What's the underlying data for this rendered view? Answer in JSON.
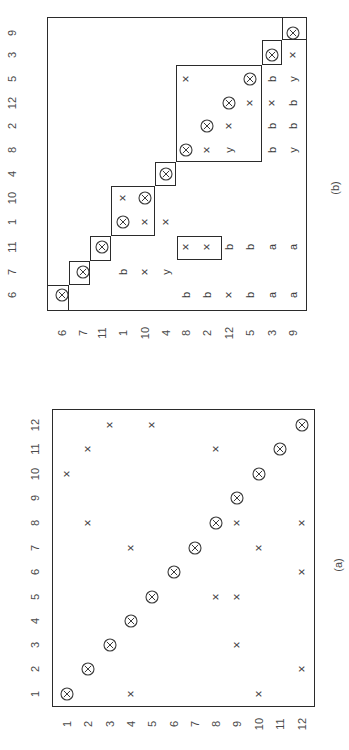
{
  "figure": {
    "orientation": "rotated -90deg",
    "panels": [
      {
        "id": "a",
        "caption": "(a)",
        "caption_pos": [
          338,
          565
        ],
        "frame": {
          "left": 52,
          "top": 409,
          "right": 315,
          "bottom": 707
        },
        "row_labels": [
          "1",
          "2",
          "3",
          "4",
          "5",
          "6",
          "7",
          "8",
          "9",
          "10",
          "11",
          "12"
        ],
        "col_labels": [
          "1",
          "2",
          "3",
          "4",
          "5",
          "6",
          "7",
          "8",
          "9",
          "10",
          "11",
          "12"
        ],
        "row_label_x": 35,
        "row_y": {
          "1": 694,
          "2": 669,
          "3": 645,
          "4": 621,
          "5": 597,
          "6": 572,
          "7": 548,
          "8": 523,
          "9": 498,
          "10": 474,
          "11": 449,
          "12": 425
        },
        "col_label_y": 724,
        "col_x": {
          "1": 67,
          "2": 88,
          "3": 110,
          "4": 131,
          "5": 152,
          "6": 174,
          "7": 195,
          "8": 216,
          "9": 237,
          "10": 259,
          "11": 280,
          "12": 302
        },
        "entries": [
          {
            "row": "1",
            "col": "1",
            "v": "⊗"
          },
          {
            "row": "1",
            "col": "4",
            "v": "×"
          },
          {
            "row": "1",
            "col": "10",
            "v": "×"
          },
          {
            "row": "2",
            "col": "2",
            "v": "⊗"
          },
          {
            "row": "2",
            "col": "12",
            "v": "×"
          },
          {
            "row": "3",
            "col": "3",
            "v": "⊗"
          },
          {
            "row": "3",
            "col": "9",
            "v": "×"
          },
          {
            "row": "4",
            "col": "4",
            "v": "⊗"
          },
          {
            "row": "5",
            "col": "5",
            "v": "⊗"
          },
          {
            "row": "5",
            "col": "8",
            "v": "×"
          },
          {
            "row": "5",
            "col": "9",
            "v": "×"
          },
          {
            "row": "6",
            "col": "6",
            "v": "⊗"
          },
          {
            "row": "6",
            "col": "12",
            "v": "×"
          },
          {
            "row": "7",
            "col": "4",
            "v": "×"
          },
          {
            "row": "7",
            "col": "7",
            "v": "⊗"
          },
          {
            "row": "7",
            "col": "10",
            "v": "×"
          },
          {
            "row": "8",
            "col": "2",
            "v": "×"
          },
          {
            "row": "8",
            "col": "8",
            "v": "⊗"
          },
          {
            "row": "8",
            "col": "9",
            "v": "×"
          },
          {
            "row": "8",
            "col": "12",
            "v": "×"
          },
          {
            "row": "9",
            "col": "9",
            "v": "⊗"
          },
          {
            "row": "10",
            "col": "1",
            "v": "×"
          },
          {
            "row": "10",
            "col": "10",
            "v": "⊗"
          },
          {
            "row": "11",
            "col": "2",
            "v": "×"
          },
          {
            "row": "11",
            "col": "8",
            "v": "×"
          },
          {
            "row": "11",
            "col": "11",
            "v": "⊗"
          },
          {
            "row": "12",
            "col": "3",
            "v": "×"
          },
          {
            "row": "12",
            "col": "5",
            "v": "×"
          },
          {
            "row": "12",
            "col": "12",
            "v": "⊗"
          }
        ],
        "blocks": []
      },
      {
        "id": "b",
        "caption": "(b)",
        "caption_pos": [
          335,
          188
        ],
        "frame": {
          "left": 47,
          "top": 17,
          "right": 307,
          "bottom": 311
        },
        "row_labels": [
          "6",
          "7",
          "11",
          "1",
          "10",
          "4",
          "8",
          "2",
          "12",
          "5",
          "3",
          "9"
        ],
        "col_labels": [
          "6",
          "7",
          "11",
          "1",
          "10",
          "4",
          "8",
          "2",
          "12",
          "5",
          "3",
          "9"
        ],
        "row_label_x": 12,
        "row_y": {
          "6": 295,
          "7": 272,
          "11": 247,
          "1": 222,
          "10": 198,
          "4": 174,
          "8": 150,
          "2": 126,
          "12": 103,
          "5": 79,
          "3": 55,
          "9": 33
        },
        "col_label_y": 333,
        "col_x": {
          "6": 62,
          "7": 83,
          "11": 102,
          "1": 123,
          "10": 145,
          "4": 166,
          "8": 186,
          "2": 207,
          "12": 229,
          "5": 250,
          "3": 272,
          "9": 293
        },
        "entries": [
          {
            "row": "6",
            "col": "6",
            "v": "⊗"
          },
          {
            "row": "6",
            "col": "8",
            "v": "b"
          },
          {
            "row": "6",
            "col": "2",
            "v": "b"
          },
          {
            "row": "6",
            "col": "12",
            "v": "×"
          },
          {
            "row": "6",
            "col": "5",
            "v": "b"
          },
          {
            "row": "6",
            "col": "3",
            "v": "a"
          },
          {
            "row": "6",
            "col": "9",
            "v": "a"
          },
          {
            "row": "7",
            "col": "7",
            "v": "⊗"
          },
          {
            "row": "7",
            "col": "1",
            "v": "b"
          },
          {
            "row": "7",
            "col": "10",
            "v": "×"
          },
          {
            "row": "7",
            "col": "4",
            "v": "y"
          },
          {
            "row": "11",
            "col": "11",
            "v": "⊗"
          },
          {
            "row": "11",
            "col": "8",
            "v": "×"
          },
          {
            "row": "11",
            "col": "2",
            "v": "×"
          },
          {
            "row": "11",
            "col": "12",
            "v": "b"
          },
          {
            "row": "11",
            "col": "5",
            "v": "b"
          },
          {
            "row": "11",
            "col": "3",
            "v": "a"
          },
          {
            "row": "11",
            "col": "9",
            "v": "a"
          },
          {
            "row": "1",
            "col": "1",
            "v": "⊗"
          },
          {
            "row": "1",
            "col": "10",
            "v": "×"
          },
          {
            "row": "1",
            "col": "4",
            "v": "×"
          },
          {
            "row": "10",
            "col": "1",
            "v": "×"
          },
          {
            "row": "10",
            "col": "10",
            "v": "⊗"
          },
          {
            "row": "4",
            "col": "4",
            "v": "⊗"
          },
          {
            "row": "8",
            "col": "8",
            "v": "⊗"
          },
          {
            "row": "8",
            "col": "2",
            "v": "×"
          },
          {
            "row": "8",
            "col": "12",
            "v": "y"
          },
          {
            "row": "8",
            "col": "3",
            "v": "b"
          },
          {
            "row": "8",
            "col": "9",
            "v": "y"
          },
          {
            "row": "2",
            "col": "2",
            "v": "⊗"
          },
          {
            "row": "2",
            "col": "12",
            "v": "×"
          },
          {
            "row": "2",
            "col": "3",
            "v": "b"
          },
          {
            "row": "2",
            "col": "9",
            "v": "b"
          },
          {
            "row": "12",
            "col": "12",
            "v": "⊗"
          },
          {
            "row": "12",
            "col": "5",
            "v": "×"
          },
          {
            "row": "12",
            "col": "3",
            "v": "×"
          },
          {
            "row": "12",
            "col": "9",
            "v": "b"
          },
          {
            "row": "5",
            "col": "8",
            "v": "×"
          },
          {
            "row": "5",
            "col": "5",
            "v": "⊗"
          },
          {
            "row": "5",
            "col": "3",
            "v": "b"
          },
          {
            "row": "5",
            "col": "9",
            "v": "y"
          },
          {
            "row": "3",
            "col": "3",
            "v": "⊗"
          },
          {
            "row": "3",
            "col": "9",
            "v": "×"
          },
          {
            "row": "9",
            "col": "9",
            "v": "⊗"
          }
        ],
        "blocks": [
          {
            "name": "block-6",
            "left": 47,
            "top": 285,
            "right": 69,
            "bottom": 311
          },
          {
            "name": "block-7",
            "left": 69,
            "top": 261,
            "right": 90,
            "bottom": 285
          },
          {
            "name": "block-11",
            "left": 90,
            "top": 236,
            "right": 111,
            "bottom": 261
          },
          {
            "name": "block-1-10",
            "left": 111,
            "top": 186,
            "right": 155,
            "bottom": 236
          },
          {
            "name": "block-4",
            "left": 155,
            "top": 162,
            "right": 176,
            "bottom": 186
          },
          {
            "name": "block-8-2-12-5",
            "left": 176,
            "top": 65,
            "right": 262,
            "bottom": 162
          },
          {
            "name": "block-3",
            "left": 262,
            "top": 40,
            "right": 282,
            "bottom": 65
          },
          {
            "name": "block-9",
            "left": 282,
            "top": 17,
            "right": 307,
            "bottom": 40
          },
          {
            "name": "row11-cols8-2-box",
            "left": 177,
            "top": 236,
            "right": 222,
            "bottom": 260
          }
        ]
      }
    ]
  }
}
